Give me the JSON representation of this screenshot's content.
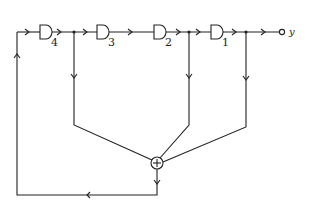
{
  "diagram": {
    "title": "",
    "delays": [
      {
        "id": "d4",
        "label": "4"
      },
      {
        "id": "d3",
        "label": "3"
      },
      {
        "id": "d2",
        "label": "2"
      },
      {
        "id": "d1",
        "label": "1"
      }
    ],
    "adder": {
      "symbol": "+"
    },
    "output": {
      "label": "y"
    },
    "colors": {
      "line": "#222222",
      "background": "#ffffff"
    }
  }
}
